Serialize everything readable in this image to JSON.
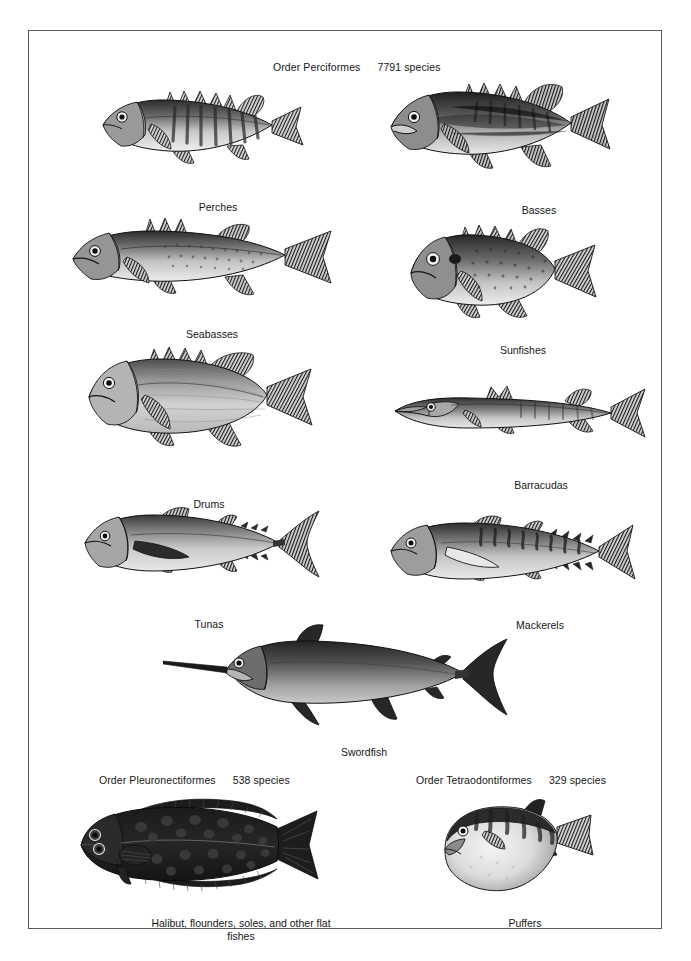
{
  "plate": {
    "background_color": "#ffffff",
    "border_color": "#5a5a5a",
    "ink_color": "#161616"
  },
  "orders": [
    {
      "id": "perciformes",
      "name": "Order Perciformes",
      "species_count": "7791 species"
    },
    {
      "id": "pleuronectiformes",
      "name": "Order Pleuronectiformes",
      "species_count": "538 species"
    },
    {
      "id": "tetraodontiformes",
      "name": "Order Tetraodontiformes",
      "species_count": "329 species"
    }
  ],
  "figures": [
    {
      "id": "perches",
      "caption": "Perches"
    },
    {
      "id": "basses",
      "caption": "Basses"
    },
    {
      "id": "seabasses",
      "caption": "Seabasses"
    },
    {
      "id": "sunfishes",
      "caption": "Sunfishes"
    },
    {
      "id": "drums",
      "caption": "Drums"
    },
    {
      "id": "barracudas",
      "caption": "Barracudas"
    },
    {
      "id": "tunas",
      "caption": "Tunas"
    },
    {
      "id": "mackerels",
      "caption": "Mackerels"
    },
    {
      "id": "swordfish",
      "caption": "Swordfish"
    },
    {
      "id": "flatfishes",
      "caption": "Halibut, flounders, soles, and other flat fishes"
    },
    {
      "id": "puffers",
      "caption": "Puffers"
    }
  ]
}
